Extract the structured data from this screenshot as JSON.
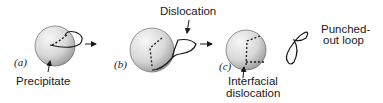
{
  "panels": [
    {
      "tag": "(a)",
      "label": "Precipitate"
    },
    {
      "tag": "(b)",
      "label": "Dislocation"
    },
    {
      "tag": "(c)",
      "label_line1": "Interfacial",
      "label_line2": "dislocation"
    }
  ],
  "loop": {
    "label_line1": "Punched-",
    "label_line2": "out loop"
  },
  "colors": {
    "line": "#1a1a1a",
    "sphere_light": "#f4f4f4",
    "sphere_dark": "#a8a8a8"
  }
}
